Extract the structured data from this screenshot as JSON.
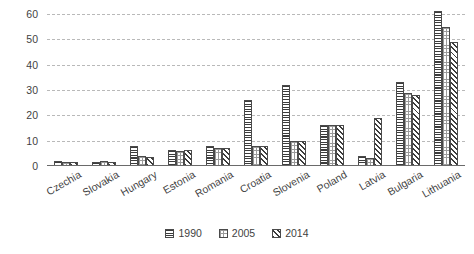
{
  "chart_data": {
    "type": "bar",
    "title": "",
    "subtitle": "",
    "xlabel": "",
    "ylabel": "",
    "ylim": [
      0,
      60
    ],
    "yticks": [
      0,
      10,
      20,
      30,
      40,
      50,
      60
    ],
    "grid": true,
    "legend_position": "bottom",
    "categories": [
      "Czechia",
      "Slovakia",
      "Hungary",
      "Estonia",
      "Romania",
      "Croatia",
      "Slovenia",
      "Poland",
      "Latvia",
      "Bulgaria",
      "Lithuania"
    ],
    "series": [
      {
        "name": "1990",
        "pattern": "horizontal-stripes",
        "values": [
          1.8,
          1.6,
          8.0,
          6.5,
          8.0,
          26.0,
          32.0,
          16.0,
          4.0,
          33.0,
          61.0
        ]
      },
      {
        "name": "2005",
        "pattern": "dotted",
        "values": [
          1.6,
          1.8,
          4.0,
          6.0,
          7.0,
          8.0,
          10.0,
          16.0,
          3.0,
          29.0,
          55.0
        ]
      },
      {
        "name": "2014",
        "pattern": "diagonal-stripes",
        "values": [
          1.5,
          1.6,
          3.5,
          6.5,
          7.0,
          8.0,
          10.0,
          16.0,
          19.0,
          28.0,
          49.0
        ]
      }
    ],
    "colors": {
      "bar_outline": "#4a4a4a",
      "bar_fill": "#ffffff",
      "gridline": "#b9b9b9",
      "axis": "#6a6a6a",
      "text": "#3f3f3f",
      "background": "#ffffff"
    }
  }
}
